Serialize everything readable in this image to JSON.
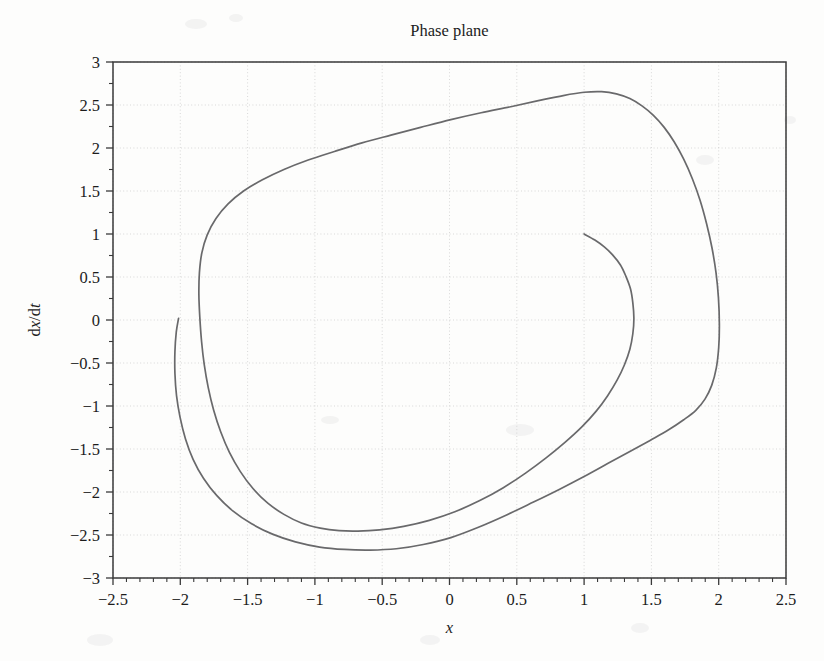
{
  "figure": {
    "title": "Phase plane",
    "background_color": "#fdfdfc",
    "curve_color": "#69696b",
    "axis_color": "#3a3a3a",
    "grid_color": "#c9c9c9"
  },
  "axes": {
    "x_label": "x",
    "y_label": "dx/dt",
    "y_label_parts": {
      "d1": "d",
      "x": "x",
      "slash": "/",
      "d2": "d",
      "t": "t"
    },
    "x_ticks": [
      "-2.5",
      "-2",
      "-1.5",
      "-1",
      "-0.5",
      "0",
      "0.5",
      "1",
      "1.5",
      "2",
      "2.5"
    ],
    "y_ticks": [
      "3",
      "2.5",
      "2",
      "1.5",
      "1",
      "0.5",
      "0",
      "-0.5",
      "-1",
      "-1.5",
      "-2",
      "-2.5",
      "-3"
    ],
    "x_minor_per_interval": 5,
    "y_minor_per_interval": 1,
    "grid": true,
    "tick_direction": "out"
  },
  "chart_data": {
    "type": "line",
    "title": "Phase plane",
    "xlabel": "x",
    "ylabel": "dx/dt",
    "xlim": [
      -2.5,
      2.5
    ],
    "ylim": [
      -3,
      3
    ],
    "xticks": [
      -2.5,
      -2,
      -1.5,
      -1,
      -0.5,
      0,
      0.5,
      1,
      1.5,
      2,
      2.5
    ],
    "yticks": [
      3,
      2.5,
      2,
      1.5,
      1,
      0.5,
      0,
      -0.5,
      -1,
      -1.5,
      -2,
      -2.5,
      -3
    ],
    "grid": true,
    "legend": null,
    "series": [
      {
        "name": "trajectory",
        "start_point": [
          1.0,
          1.0
        ],
        "end_point": [
          -2.0,
          0.0
        ],
        "closed": false,
        "points": [
          [
            1.0,
            1.0
          ],
          [
            1.08,
            0.93
          ],
          [
            1.15,
            0.85
          ],
          [
            1.21,
            0.76
          ],
          [
            1.27,
            0.64
          ],
          [
            1.31,
            0.51
          ],
          [
            1.345,
            0.36
          ],
          [
            1.362,
            0.2
          ],
          [
            1.37,
            0.02
          ],
          [
            1.362,
            -0.16
          ],
          [
            1.34,
            -0.34
          ],
          [
            1.3,
            -0.52
          ],
          [
            1.245,
            -0.7
          ],
          [
            1.175,
            -0.88
          ],
          [
            1.09,
            -1.06
          ],
          [
            0.985,
            -1.24
          ],
          [
            0.86,
            -1.42
          ],
          [
            0.72,
            -1.6
          ],
          [
            0.565,
            -1.78
          ],
          [
            0.4,
            -1.95
          ],
          [
            0.225,
            -2.1
          ],
          [
            0.04,
            -2.23
          ],
          [
            -0.15,
            -2.33
          ],
          [
            -0.34,
            -2.4
          ],
          [
            -0.52,
            -2.44
          ],
          [
            -0.68,
            -2.455
          ],
          [
            -0.82,
            -2.45
          ],
          [
            -0.96,
            -2.42
          ],
          [
            -1.1,
            -2.36
          ],
          [
            -1.23,
            -2.26
          ],
          [
            -1.35,
            -2.13
          ],
          [
            -1.46,
            -1.96
          ],
          [
            -1.555,
            -1.76
          ],
          [
            -1.635,
            -1.54
          ],
          [
            -1.7,
            -1.3
          ],
          [
            -1.752,
            -1.05
          ],
          [
            -1.792,
            -0.79
          ],
          [
            -1.822,
            -0.52
          ],
          [
            -1.842,
            -0.25
          ],
          [
            -1.855,
            0.03
          ],
          [
            -1.862,
            0.3
          ],
          [
            -1.858,
            0.55
          ],
          [
            -1.84,
            0.78
          ],
          [
            -1.8,
            0.99
          ],
          [
            -1.735,
            1.18
          ],
          [
            -1.645,
            1.35
          ],
          [
            -1.53,
            1.5
          ],
          [
            -1.39,
            1.63
          ],
          [
            -1.23,
            1.75
          ],
          [
            -1.05,
            1.86
          ],
          [
            -0.855,
            1.96
          ],
          [
            -0.65,
            2.06
          ],
          [
            -0.435,
            2.15
          ],
          [
            -0.215,
            2.24
          ],
          [
            0.01,
            2.33
          ],
          [
            0.235,
            2.41
          ],
          [
            0.455,
            2.48
          ],
          [
            0.66,
            2.55
          ],
          [
            0.845,
            2.61
          ],
          [
            1.0,
            2.648
          ],
          [
            1.13,
            2.655
          ],
          [
            1.24,
            2.63
          ],
          [
            1.34,
            2.575
          ],
          [
            1.43,
            2.49
          ],
          [
            1.515,
            2.38
          ],
          [
            1.595,
            2.24
          ],
          [
            1.67,
            2.07
          ],
          [
            1.74,
            1.87
          ],
          [
            1.805,
            1.64
          ],
          [
            1.862,
            1.39
          ],
          [
            1.91,
            1.12
          ],
          [
            1.95,
            0.84
          ],
          [
            1.98,
            0.55
          ],
          [
            1.998,
            0.26
          ],
          [
            2.005,
            -0.05
          ],
          [
            2.0,
            -0.32
          ],
          [
            1.982,
            -0.56
          ],
          [
            1.948,
            -0.76
          ],
          [
            1.898,
            -0.92
          ],
          [
            1.83,
            -1.05
          ],
          [
            1.74,
            -1.16
          ],
          [
            1.625,
            -1.28
          ],
          [
            1.49,
            -1.4
          ],
          [
            1.34,
            -1.53
          ],
          [
            1.175,
            -1.67
          ],
          [
            1.0,
            -1.82
          ],
          [
            0.815,
            -1.97
          ],
          [
            0.62,
            -2.12
          ],
          [
            0.42,
            -2.27
          ],
          [
            0.215,
            -2.41
          ],
          [
            0.01,
            -2.53
          ],
          [
            -0.195,
            -2.61
          ],
          [
            -0.395,
            -2.66
          ],
          [
            -0.59,
            -2.675
          ],
          [
            -0.78,
            -2.668
          ],
          [
            -0.965,
            -2.64
          ],
          [
            -1.145,
            -2.58
          ],
          [
            -1.315,
            -2.49
          ],
          [
            -1.47,
            -2.37
          ],
          [
            -1.61,
            -2.22
          ],
          [
            -1.73,
            -2.04
          ],
          [
            -1.828,
            -1.84
          ],
          [
            -1.905,
            -1.62
          ],
          [
            -1.962,
            -1.38
          ],
          [
            -2.002,
            -1.13
          ],
          [
            -2.028,
            -0.88
          ],
          [
            -2.04,
            -0.62
          ],
          [
            -2.04,
            -0.37
          ],
          [
            -2.03,
            -0.14
          ],
          [
            -2.013,
            0.02
          ]
        ]
      }
    ]
  }
}
